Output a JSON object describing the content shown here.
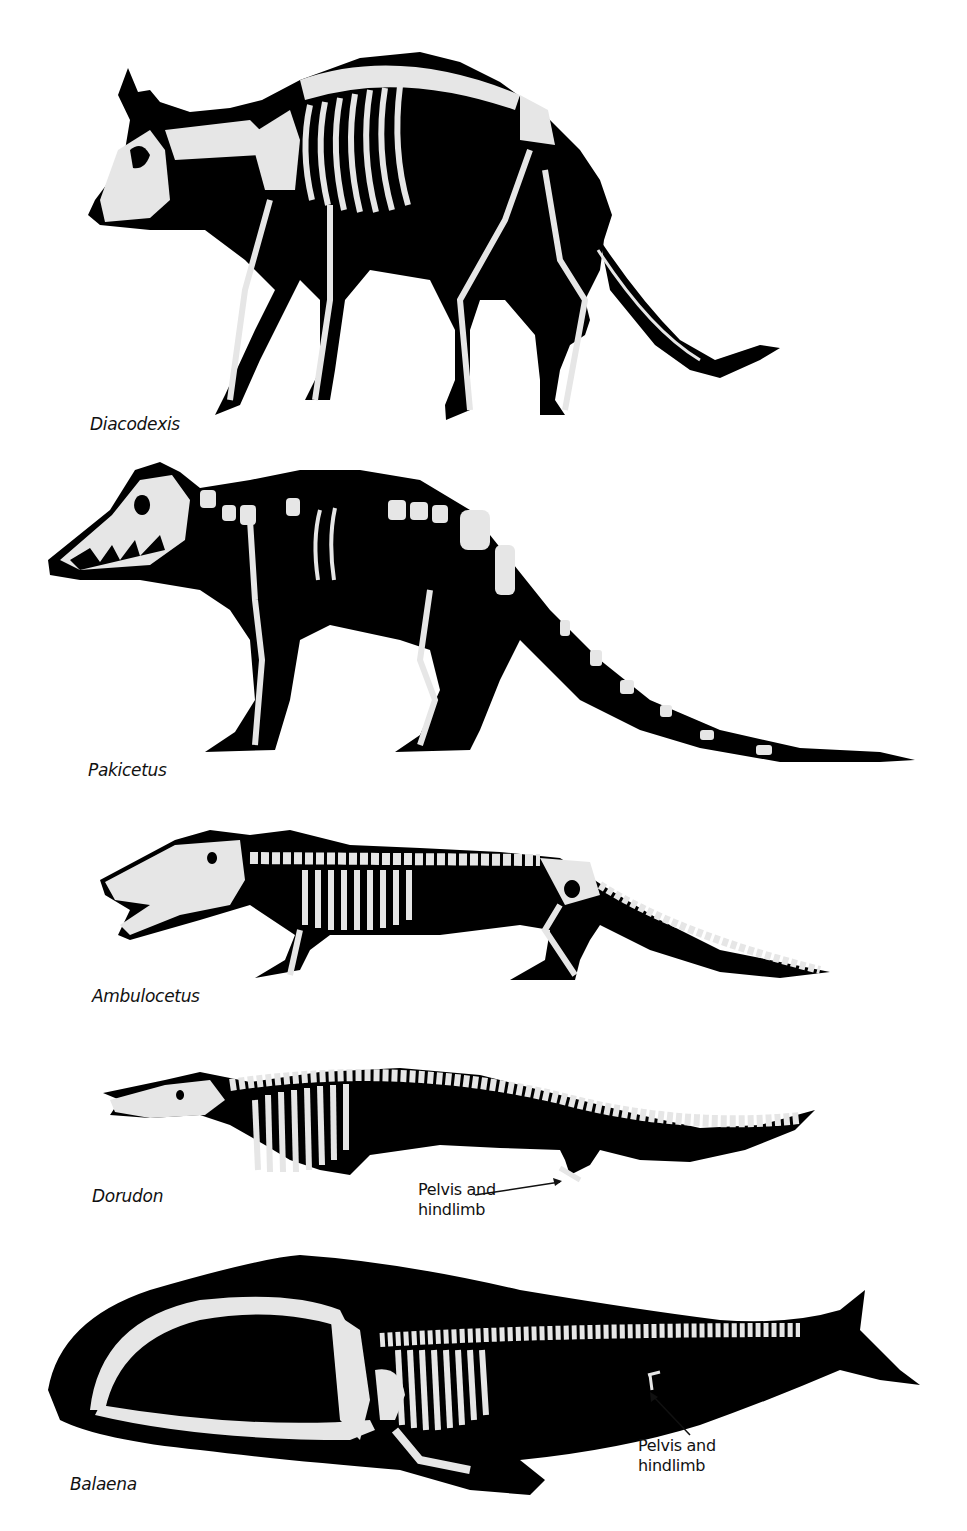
{
  "figure": {
    "colors": {
      "silhouette": "#000000",
      "bone": "#e6e6e6",
      "background": "#ffffff",
      "text": "#111111"
    },
    "animals": [
      {
        "name": "Diacodexis",
        "order": 1
      },
      {
        "name": "Pakicetus",
        "order": 2
      },
      {
        "name": "Ambulocetus",
        "order": 3
      },
      {
        "name": "Dorudon",
        "order": 4,
        "callout": {
          "line1": "Pelvis and",
          "line2": "hindlimb"
        }
      },
      {
        "name": "Balaena",
        "order": 5,
        "callout": {
          "line1": "Pelvis and",
          "line2": "hindlimb"
        }
      }
    ]
  }
}
